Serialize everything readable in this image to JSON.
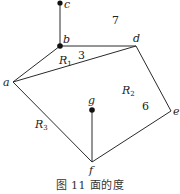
{
  "figure": {
    "caption": "图 11   面的度",
    "vertices": [
      {
        "id": "c",
        "label": "c",
        "x": 60,
        "y": 3,
        "dot": true
      },
      {
        "id": "b",
        "label": "b",
        "x": 60,
        "y": 46,
        "dot": true
      },
      {
        "id": "d",
        "label": "d",
        "x": 136,
        "y": 46,
        "dot": false
      },
      {
        "id": "a",
        "label": "a",
        "x": 13,
        "y": 82,
        "dot": false
      },
      {
        "id": "e",
        "label": "e",
        "x": 171,
        "y": 111,
        "dot": false
      },
      {
        "id": "f",
        "label": "f",
        "x": 92,
        "y": 162,
        "dot": false
      },
      {
        "id": "g",
        "label": "g",
        "x": 92,
        "y": 110,
        "dot": true
      }
    ],
    "edges": [
      [
        "c",
        "b"
      ],
      [
        "b",
        "d"
      ],
      [
        "b",
        "a"
      ],
      [
        "a",
        "d"
      ],
      [
        "d",
        "e"
      ],
      [
        "e",
        "f"
      ],
      [
        "a",
        "f"
      ],
      [
        "g",
        "f"
      ]
    ],
    "regions": [
      {
        "name": "R",
        "sub": "1",
        "degree": "3"
      },
      {
        "name": "R",
        "sub": "2",
        "degree": "6"
      },
      {
        "name": "R",
        "sub": "3",
        "degree": "7"
      }
    ],
    "colors": {
      "stroke": "#2a2a2a",
      "vertex": "#111111",
      "text": "#222222"
    }
  }
}
